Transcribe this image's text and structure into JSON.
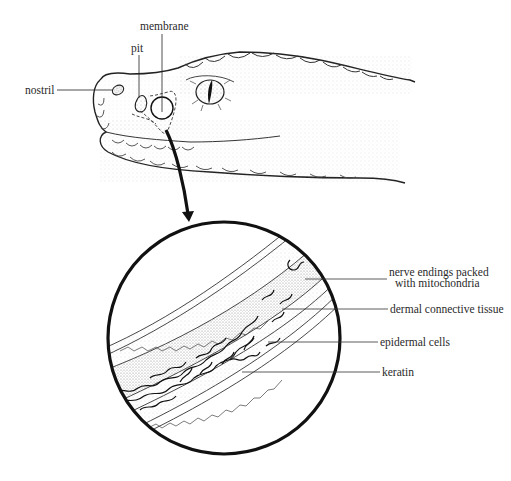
{
  "figure": {
    "type": "anatomical diagram"
  },
  "head_labels": {
    "membrane": "membrane",
    "pit": "pit",
    "nostril": "nostril"
  },
  "inset_labels": {
    "nerve_line1": "nerve endings packed",
    "nerve_line2": "with mitochondria",
    "dermal": "dermal connective tissue",
    "epidermal": "epidermal cells",
    "keratin": "keratin"
  },
  "colors": {
    "ink": "#111111",
    "label_text": "#2a2a2a",
    "stipple": "#9a9a9a",
    "background": "#ffffff"
  }
}
